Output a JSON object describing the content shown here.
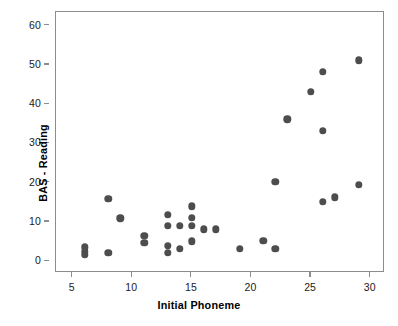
{
  "chart_data": {
    "type": "scatter",
    "title": "",
    "xlabel": "Initial Phoneme",
    "ylabel": "BAS - Reading",
    "xlim": [
      3.6,
      31.2
    ],
    "ylim": [
      -3.0,
      63.5
    ],
    "xticks": [
      5,
      10,
      15,
      20,
      25,
      30
    ],
    "xtick_labels": [
      "5",
      "10",
      "15",
      "20",
      "25",
      "30"
    ],
    "yticks": [
      0,
      10,
      20,
      30,
      40,
      50,
      60
    ],
    "ytick_labels": [
      "0",
      "10",
      "20",
      "30",
      "40",
      "50",
      "60"
    ],
    "grid": false,
    "legend": null,
    "marker": {
      "shape": "circle",
      "color": "#4d4d4d",
      "size_px": 7.4
    },
    "series": [
      {
        "name": "Pupils",
        "color": "#4d4d4d",
        "n_points": 34,
        "points": [
          {
            "x": 6,
            "y": 3.5
          },
          {
            "x": 6,
            "y": 2.4
          },
          {
            "x": 6,
            "y": 1.7
          },
          {
            "x": 8,
            "y": 15.9
          },
          {
            "x": 8,
            "y": 2.2
          },
          {
            "x": 9,
            "y": 10.9
          },
          {
            "x": 11,
            "y": 6.4
          },
          {
            "x": 11,
            "y": 4.7
          },
          {
            "x": 13,
            "y": 11.9
          },
          {
            "x": 13,
            "y": 9.0
          },
          {
            "x": 13,
            "y": 4.0
          },
          {
            "x": 13,
            "y": 2.2
          },
          {
            "x": 14,
            "y": 9.0
          },
          {
            "x": 14,
            "y": 3.1
          },
          {
            "x": 15,
            "y": 14.0
          },
          {
            "x": 15,
            "y": 11.0
          },
          {
            "x": 15,
            "y": 9.0
          },
          {
            "x": 15,
            "y": 5.1
          },
          {
            "x": 16,
            "y": 8.1
          },
          {
            "x": 17,
            "y": 8.1
          },
          {
            "x": 19,
            "y": 3.1
          },
          {
            "x": 21,
            "y": 5.2
          },
          {
            "x": 22,
            "y": 3.1
          },
          {
            "x": 22,
            "y": 20.2
          },
          {
            "x": 23,
            "y": 36.2
          },
          {
            "x": 25,
            "y": 43.1
          },
          {
            "x": 26,
            "y": 48.3
          },
          {
            "x": 26,
            "y": 33.2
          },
          {
            "x": 26,
            "y": 15.2
          },
          {
            "x": 27,
            "y": 16.3
          },
          {
            "x": 29,
            "y": 51.2
          },
          {
            "x": 29,
            "y": 19.4
          }
        ]
      }
    ]
  },
  "axes": {
    "x_title": "Initial Phoneme",
    "y_title": "BAS - Reading"
  }
}
